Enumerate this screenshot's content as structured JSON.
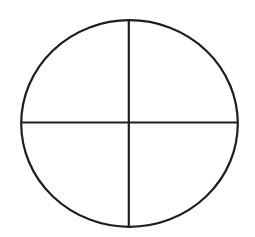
{
  "diagram": {
    "type": "circle-divided-into-quadrants",
    "background": "#ffffff",
    "stroke_color": "#1e1e1e",
    "stroke_width": 2.2,
    "circle": {
      "cx": 129.5,
      "cy": 123.5,
      "rx": 108.3,
      "ry": 103.3
    },
    "vertical_line": {
      "x": 128.8
    },
    "horizontal_line": {
      "y": 122.5
    },
    "quadrants": 4
  }
}
